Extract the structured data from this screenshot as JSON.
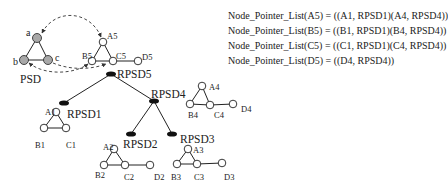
{
  "psd": {
    "title": "PSD",
    "nodes": [
      {
        "id": "a",
        "label": "a",
        "x": 37,
        "y": 38,
        "filled": true
      },
      {
        "id": "b",
        "label": "b",
        "x": 24,
        "y": 60,
        "filled": true
      },
      {
        "id": "c",
        "label": "c",
        "x": 48,
        "y": 60,
        "filled": true
      }
    ]
  },
  "hierarchy": [
    {
      "id": "RPSD5",
      "label": "RPSD5",
      "x": 111,
      "y": 74
    },
    {
      "id": "RPSD1",
      "label": "RPSD1",
      "x": 64,
      "y": 103
    },
    {
      "id": "RPSD4",
      "label": "RPSD4",
      "x": 154,
      "y": 101
    },
    {
      "id": "RPSD2",
      "label": "RPSD2",
      "x": 131,
      "y": 134
    },
    {
      "id": "RPSD3",
      "label": "RPSD3",
      "x": 172,
      "y": 134
    }
  ],
  "hierarchy_edges": [
    [
      "RPSD5",
      "RPSD1"
    ],
    [
      "RPSD5",
      "RPSD4"
    ],
    [
      "RPSD4",
      "RPSD2"
    ],
    [
      "RPSD4",
      "RPSD3"
    ]
  ],
  "subgraphs": {
    "g5": {
      "A": "A5",
      "B": "B5",
      "C": "C5",
      "D": "D5"
    },
    "g1": {
      "A": "A1",
      "B": "B1",
      "C": "C1"
    },
    "g4": {
      "A": "A4",
      "B": "B4",
      "C": "C4",
      "D": "D4"
    },
    "g2": {
      "A": "A2",
      "B": "B2",
      "C": "C2",
      "D": "D2"
    },
    "g3": {
      "A": "A3",
      "B": "B3",
      "C": "C3",
      "D": "D3"
    }
  },
  "pointer_lists": [
    "Node_Pointer_List(A5) = ((A1, RPSD1)(A4, RPSD4))",
    "Node_Pointer_List(B5) = ((B1, RPSD1)(B4, RPSD4))",
    "Node_Pointer_List(C5) = ((C1, RPSD1)(C4, RPSD4))",
    "Node_Pointer_List(D5) = ((D4, RPSD4))"
  ],
  "colors": {
    "line": "#222222",
    "node_fill": "#ffffff",
    "psd_node_fill": "#a8a8a8",
    "dashed": "#333333"
  }
}
